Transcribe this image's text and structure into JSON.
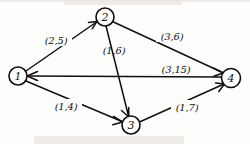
{
  "figure": {
    "kind": "directed-graph-diagram",
    "background_color": "#fdfdfb",
    "ink_color": "#101010",
    "width": 250,
    "height": 144
  },
  "nodes": [
    {
      "id": "1",
      "label": "1",
      "cx": 18,
      "cy": 76,
      "r": 9
    },
    {
      "id": "2",
      "label": "2",
      "cx": 105,
      "cy": 17,
      "r": 9
    },
    {
      "id": "3",
      "label": "3",
      "cx": 131,
      "cy": 125,
      "r": 9
    },
    {
      "id": "4",
      "label": "4",
      "cx": 231,
      "cy": 78,
      "r": 9.5
    }
  ],
  "edges": [
    {
      "id": "e12",
      "from": "1",
      "to": "2",
      "label": "(2,5)",
      "label_x": 56,
      "label_y": 40
    },
    {
      "id": "e23",
      "from": "2",
      "to": "3",
      "label": "(1,6)",
      "label_x": 114,
      "label_y": 50
    },
    {
      "id": "e24",
      "from": "2",
      "to": "4",
      "label": "(3,6)",
      "label_x": 172,
      "label_y": 36
    },
    {
      "id": "e41",
      "from": "4",
      "to": "1",
      "label": "(3,15)",
      "label_x": 176,
      "label_y": 69
    },
    {
      "id": "e13",
      "from": "1",
      "to": "3",
      "label": "(1,4)",
      "label_x": 66,
      "label_y": 106
    },
    {
      "id": "e34",
      "from": "3",
      "to": "4",
      "label": "(1,7)",
      "label_x": 187,
      "label_y": 107
    }
  ]
}
